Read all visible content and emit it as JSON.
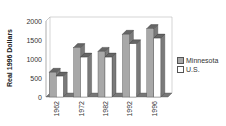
{
  "chart_data": {
    "type": "bar",
    "title": "",
    "xlabel": "",
    "ylabel": "Real 1996 Dollars",
    "ylim": [
      0,
      2000
    ],
    "yticks": [
      0,
      500,
      1000,
      1500,
      2000
    ],
    "categories": [
      "1962",
      "1972",
      "1982",
      "1992",
      "1996"
    ],
    "series": [
      {
        "name": "Minnesota",
        "values": [
          650,
          1300,
          1200,
          1650,
          1800
        ],
        "color": "#a8a8a8"
      },
      {
        "name": "U.S.",
        "values": [
          550,
          1050,
          1050,
          1400,
          1550
        ],
        "color": "#ffffff"
      }
    ],
    "legend": "right",
    "grid": false,
    "style": "3d-column"
  }
}
